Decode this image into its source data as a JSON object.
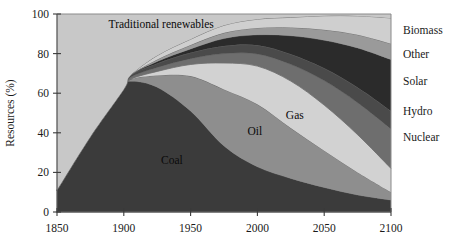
{
  "chart_data": {
    "type": "area",
    "stacked": true,
    "title": "",
    "xlabel": "",
    "ylabel": "Resources (%)",
    "xlim": [
      1850,
      2100
    ],
    "ylim": [
      0,
      100
    ],
    "grid": false,
    "legend_position": "right",
    "x_ticks": [
      1850,
      1900,
      1950,
      2000,
      2050,
      2100
    ],
    "y_ticks": [
      0,
      20,
      40,
      60,
      80,
      100
    ],
    "x": [
      1850,
      1875,
      1900,
      1905,
      1925,
      1950,
      1975,
      2000,
      2025,
      2050,
      2075,
      2100
    ],
    "series": [
      {
        "name": "Coal",
        "color": "#3b3b3b",
        "inline_label": "Coal",
        "values": [
          11,
          38,
          62,
          66,
          63,
          52,
          35,
          26,
          20,
          14,
          9,
          6
        ]
      },
      {
        "name": "Oil",
        "color": "#8e8e8e",
        "inline_label": "Oil",
        "values": [
          0,
          0,
          0,
          1,
          6,
          18,
          30,
          36,
          30,
          21,
          12,
          4
        ]
      },
      {
        "name": "Gas",
        "color": "#d2d2d2",
        "inline_label": "Gas",
        "values": [
          0,
          0,
          0,
          0,
          2,
          6,
          14,
          22,
          28,
          26,
          20,
          12
        ]
      },
      {
        "name": "Nuclear",
        "color": "#6e6e6e",
        "inline_label": "",
        "values": [
          0,
          0,
          0,
          1,
          2,
          3,
          5,
          7,
          10,
          14,
          17,
          20
        ]
      },
      {
        "name": "Hydro",
        "color": "#4a4a4a",
        "inline_label": "",
        "values": [
          0,
          0,
          0,
          1,
          2,
          3,
          4,
          5,
          6,
          7,
          8,
          9
        ]
      },
      {
        "name": "Solar",
        "color": "#2b2b2b",
        "inline_label": "",
        "values": [
          0,
          0,
          0,
          0,
          1,
          2,
          4,
          6,
          11,
          16,
          21,
          26
        ]
      },
      {
        "name": "Other",
        "color": "#9a9a9a",
        "inline_label": "",
        "values": [
          0,
          0,
          0,
          0,
          1,
          2,
          3,
          4,
          5,
          6,
          7,
          8
        ]
      },
      {
        "name": "Biomass",
        "color": "#cfcfcf",
        "inline_label": "",
        "values": [
          0,
          0,
          0,
          0,
          2,
          3,
          4,
          5,
          6,
          8,
          10,
          13
        ]
      },
      {
        "name": "Traditional renewables",
        "color": "#c8c8c8",
        "inline_label": "Traditional renewables",
        "values": [
          89,
          62,
          38,
          31,
          21,
          13,
          6,
          3,
          2,
          1,
          1,
          2
        ]
      }
    ],
    "legend": [
      {
        "label": "Biomass",
        "y_pct": 92
      },
      {
        "label": "Other",
        "y_pct": 80
      },
      {
        "label": "Solar",
        "y_pct": 66
      },
      {
        "label": "Hydro",
        "y_pct": 51
      },
      {
        "label": "Nuclear",
        "y_pct": 38
      }
    ],
    "inline_annotations": [
      {
        "text": "Traditional renewables",
        "x_year": 1928,
        "y_pct": 93
      },
      {
        "text": "Coal",
        "x_year": 1936,
        "y_pct": 24
      },
      {
        "text": "Oil",
        "x_year": 1998,
        "y_pct": 39
      },
      {
        "text": "Gas",
        "x_year": 2028,
        "y_pct": 47
      }
    ]
  }
}
